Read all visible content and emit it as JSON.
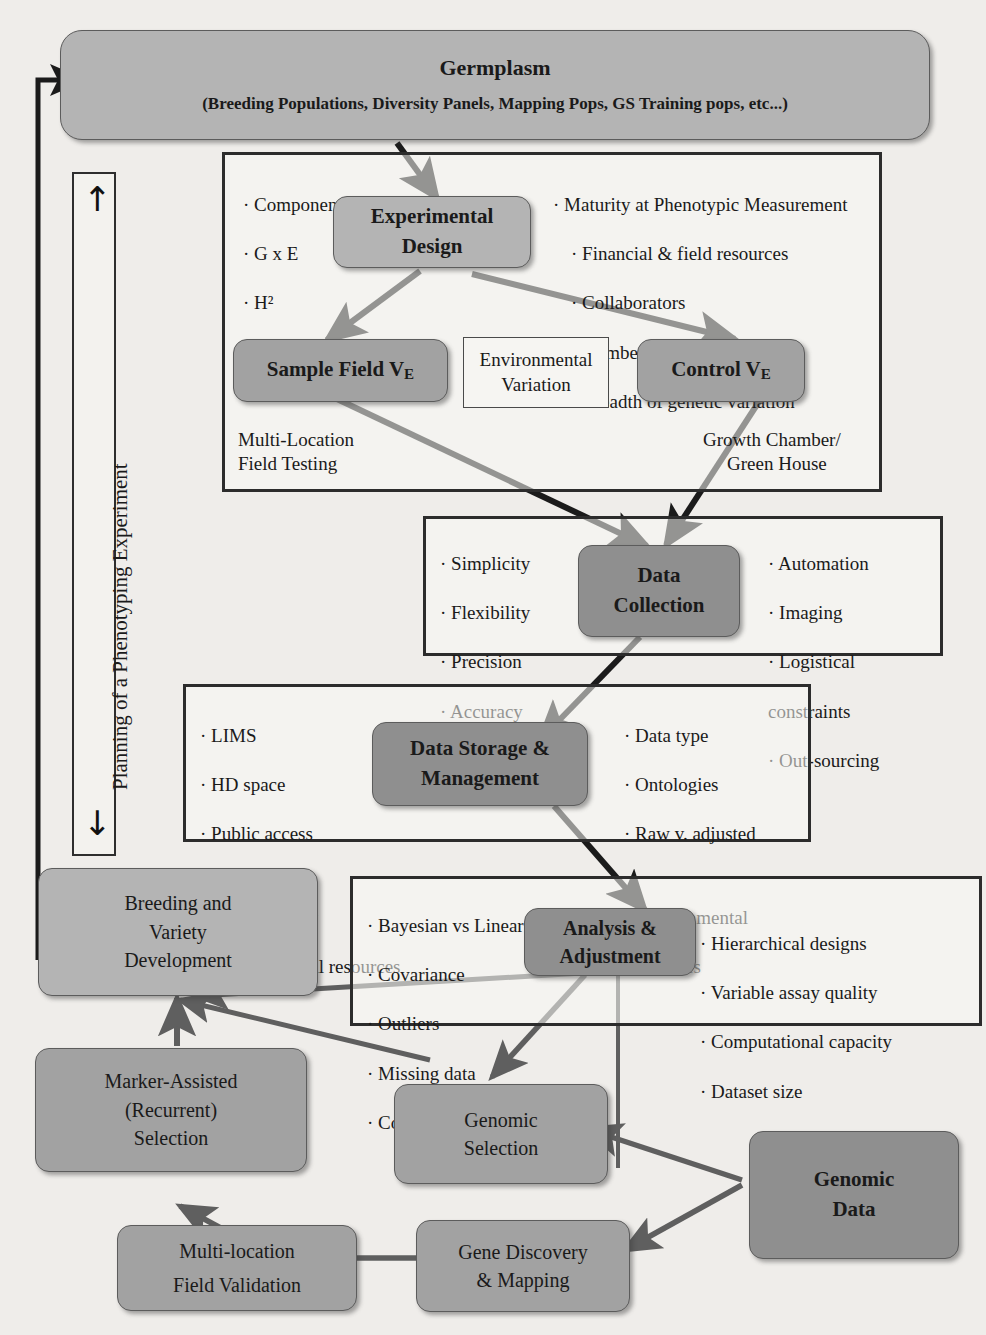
{
  "diagram": {
    "side_rail": {
      "label": "Planning of a Phenotyping Experiment",
      "up_arrow": "↑",
      "down_arrow": "↓"
    },
    "nodes": {
      "germplasm": {
        "line1": "Germplasm",
        "line2": "(Breeding Populations, Diversity Panels, Mapping Pops, GS Training pops, etc...)"
      },
      "experimental_design": {
        "line1": "Experimental",
        "line2": "Design"
      },
      "sample_field": {
        "text": "Sample Field V",
        "sub": "E"
      },
      "control": {
        "text": "Control V",
        "sub": "E"
      },
      "environmental_variation": {
        "line1": "Environmental",
        "line2": "Variation"
      },
      "data_collection": {
        "line1": "Data",
        "line2": "Collection"
      },
      "data_storage": {
        "line1": "Data Storage &",
        "line2": "Management"
      },
      "analysis": {
        "line1": "Analysis &",
        "line2": "Adjustment"
      },
      "breeding_variety": {
        "line1": "Breeding and",
        "line2": "Variety",
        "line3": "Development"
      },
      "marker_assisted": {
        "line1": "Marker-Assisted",
        "line2": "(Recurrent)",
        "line3": "Selection"
      },
      "genomic_selection": {
        "line1": "Genomic",
        "line2": "Selection"
      },
      "multi_location": {
        "line1": "Multi-location",
        "line2": "Field Validation"
      },
      "gene_discovery": {
        "line1": "Gene Discovery",
        "line2": "& Mapping"
      },
      "genomic_data": {
        "line1": "Genomic",
        "line2": "Data"
      }
    },
    "annotations": {
      "multi_location_field_testing": {
        "line1": "Multi-Location",
        "line2": "Field Testing"
      },
      "growth_chamber": {
        "line1": "Growth Chamber/",
        "line2": "Green House"
      }
    },
    "bullet_groups": {
      "experimental_left": [
        "· Component Traits",
        "· G x E",
        "· H²"
      ],
      "experimental_right": [
        "· Maturity at Phenotypic Measurement",
        "· Financial & field resources",
        "· Collaborators",
        "· Number of lines",
        "· Breadth of genetic variation"
      ],
      "collection_left": [
        "· Simplicity",
        "· Flexibility",
        "· Precision",
        "· Accuracy",
        "· Sensitivity"
      ],
      "collection_right": [
        "· Automation",
        "· Imaging",
        "· Logistical",
        "   constraints",
        "· Out-sourcing"
      ],
      "storage_left": [
        "· LIMS",
        "· HD space",
        "· Public access",
        "",
        "· Search-ability",
        "· Computational resources"
      ],
      "storage_right": [
        "· Data type",
        "· Ontologies",
        "· Raw v. adjusted",
        "",
        "· Environmental",
        "   covariates"
      ],
      "analysis_left": [
        "· Bayesian vs Linear models",
        "· Covariance",
        "· Outliers",
        "· Missing data",
        "· Confounding variables"
      ],
      "analysis_right": [
        "· Hierarchical designs",
        "· Variable assay quality",
        "· Computational capacity",
        "· Dataset size"
      ]
    },
    "colors": {
      "page_background": "#efedea",
      "node_light": "#b4b4b4",
      "node_mid": "#a2a2a2",
      "node_dark": "#8f8f8f",
      "border": "#5c5c5c",
      "outline_box": "#2c2c2c",
      "arrow": "#1b1b1b",
      "text": "#1a1a1a"
    }
  }
}
